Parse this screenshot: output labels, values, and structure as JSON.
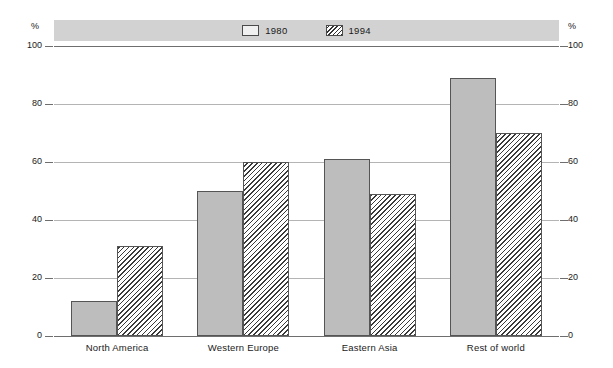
{
  "legend": {
    "entries": [
      {
        "label": "1980",
        "style": "solid",
        "color": "#bdbdbd"
      },
      {
        "label": "1994",
        "style": "hatch",
        "color": "#ffffff"
      }
    ]
  },
  "axis": {
    "unit_left": "%",
    "unit_right": "%",
    "ticks": [
      "100",
      "80",
      "60",
      "40",
      "20",
      "0"
    ]
  },
  "chart_data": {
    "type": "bar",
    "title": "",
    "xlabel": "",
    "ylabel": "%",
    "ylim": [
      0,
      100
    ],
    "yticks": [
      0,
      20,
      40,
      60,
      80,
      100
    ],
    "grid": true,
    "legend_position": "top-center",
    "categories": [
      "North America",
      "Western Europe",
      "Eastern Asia",
      "Rest of world"
    ],
    "series": [
      {
        "name": "1980",
        "values": [
          12,
          50,
          61,
          89
        ]
      },
      {
        "name": "1994",
        "values": [
          31,
          60,
          49,
          70
        ]
      }
    ]
  }
}
